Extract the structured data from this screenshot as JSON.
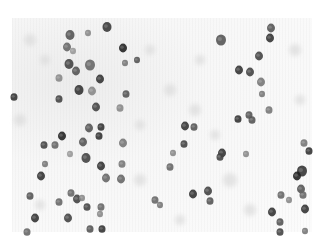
{
  "image": {
    "description": "Grayscale micrograph of stained cell nuclei scattered on a pale speckled background",
    "width": 323,
    "height": 244,
    "field": {
      "x": 12,
      "y": 18,
      "w": 300,
      "h": 214
    },
    "background_color": "#f6f6f6",
    "nucleus_colors": {
      "dark": "#2a2a2a",
      "mid": "#555555",
      "light": "#8a8a8a"
    }
  },
  "nuclei": [
    {
      "x": 107,
      "y": 27,
      "r": 4.5,
      "c": "#3a3a3a"
    },
    {
      "x": 70,
      "y": 35,
      "r": 4.5,
      "c": "#555"
    },
    {
      "x": 123,
      "y": 48,
      "r": 4,
      "c": "#222"
    },
    {
      "x": 88,
      "y": 33,
      "r": 3,
      "c": "#888"
    },
    {
      "x": 67,
      "y": 47,
      "r": 4,
      "c": "#666"
    },
    {
      "x": 73,
      "y": 51,
      "r": 3,
      "c": "#999"
    },
    {
      "x": 69,
      "y": 64,
      "r": 4.5,
      "c": "#444"
    },
    {
      "x": 90,
      "y": 65,
      "r": 5,
      "c": "#666"
    },
    {
      "x": 76,
      "y": 71,
      "r": 4,
      "c": "#555"
    },
    {
      "x": 100,
      "y": 79,
      "r": 4,
      "c": "#333"
    },
    {
      "x": 59,
      "y": 78,
      "r": 3.5,
      "c": "#888"
    },
    {
      "x": 79,
      "y": 90,
      "r": 4.5,
      "c": "#333"
    },
    {
      "x": 92,
      "y": 91,
      "r": 4,
      "c": "#888"
    },
    {
      "x": 59,
      "y": 99,
      "r": 3.5,
      "c": "#444"
    },
    {
      "x": 126,
      "y": 94,
      "r": 3.5,
      "c": "#555"
    },
    {
      "x": 96,
      "y": 107,
      "r": 4,
      "c": "#444"
    },
    {
      "x": 120,
      "y": 108,
      "r": 3.5,
      "c": "#888"
    },
    {
      "x": 14,
      "y": 97,
      "r": 3.5,
      "c": "#333"
    },
    {
      "x": 125,
      "y": 63,
      "r": 3,
      "c": "#777"
    },
    {
      "x": 137,
      "y": 60,
      "r": 3,
      "c": "#555"
    },
    {
      "x": 221,
      "y": 40,
      "r": 5,
      "c": "#555"
    },
    {
      "x": 271,
      "y": 28,
      "r": 4,
      "c": "#555"
    },
    {
      "x": 270,
      "y": 38,
      "r": 4,
      "c": "#333"
    },
    {
      "x": 259,
      "y": 56,
      "r": 4,
      "c": "#444"
    },
    {
      "x": 239,
      "y": 70,
      "r": 4,
      "c": "#333"
    },
    {
      "x": 250,
      "y": 72,
      "r": 4,
      "c": "#444"
    },
    {
      "x": 261,
      "y": 82,
      "r": 4,
      "c": "#777"
    },
    {
      "x": 262,
      "y": 94,
      "r": 3,
      "c": "#777"
    },
    {
      "x": 269,
      "y": 110,
      "r": 3.5,
      "c": "#777"
    },
    {
      "x": 249,
      "y": 115,
      "r": 3.5,
      "c": "#555"
    },
    {
      "x": 238,
      "y": 119,
      "r": 3.5,
      "c": "#333"
    },
    {
      "x": 252,
      "y": 120,
      "r": 3.5,
      "c": "#555"
    },
    {
      "x": 89,
      "y": 128,
      "r": 4,
      "c": "#555"
    },
    {
      "x": 101,
      "y": 127,
      "r": 3.5,
      "c": "#333"
    },
    {
      "x": 62,
      "y": 136,
      "r": 4,
      "c": "#222"
    },
    {
      "x": 44,
      "y": 145,
      "r": 3.5,
      "c": "#444"
    },
    {
      "x": 55,
      "y": 145,
      "r": 3.5,
      "c": "#666"
    },
    {
      "x": 83,
      "y": 142,
      "r": 4,
      "c": "#555"
    },
    {
      "x": 99,
      "y": 136,
      "r": 3.5,
      "c": "#333"
    },
    {
      "x": 123,
      "y": 143,
      "r": 4,
      "c": "#777"
    },
    {
      "x": 70,
      "y": 154,
      "r": 3,
      "c": "#999"
    },
    {
      "x": 86,
      "y": 158,
      "r": 4.5,
      "c": "#444"
    },
    {
      "x": 101,
      "y": 166,
      "r": 4,
      "c": "#333"
    },
    {
      "x": 122,
      "y": 164,
      "r": 3.5,
      "c": "#777"
    },
    {
      "x": 45,
      "y": 164,
      "r": 3,
      "c": "#777"
    },
    {
      "x": 41,
      "y": 176,
      "r": 4,
      "c": "#333"
    },
    {
      "x": 106,
      "y": 178,
      "r": 4,
      "c": "#666"
    },
    {
      "x": 121,
      "y": 179,
      "r": 4,
      "c": "#666"
    },
    {
      "x": 30,
      "y": 196,
      "r": 3.5,
      "c": "#555"
    },
    {
      "x": 71,
      "y": 193,
      "r": 3.5,
      "c": "#666"
    },
    {
      "x": 77,
      "y": 199,
      "r": 4,
      "c": "#444"
    },
    {
      "x": 59,
      "y": 202,
      "r": 3.5,
      "c": "#666"
    },
    {
      "x": 82,
      "y": 198,
      "r": 3,
      "c": "#888"
    },
    {
      "x": 87,
      "y": 207,
      "r": 3.5,
      "c": "#444"
    },
    {
      "x": 101,
      "y": 207,
      "r": 3.5,
      "c": "#666"
    },
    {
      "x": 100,
      "y": 214,
      "r": 3,
      "c": "#888"
    },
    {
      "x": 35,
      "y": 218,
      "r": 4,
      "c": "#333"
    },
    {
      "x": 68,
      "y": 218,
      "r": 4,
      "c": "#444"
    },
    {
      "x": 90,
      "y": 229,
      "r": 3.5,
      "c": "#555"
    },
    {
      "x": 102,
      "y": 229,
      "r": 3.5,
      "c": "#333"
    },
    {
      "x": 27,
      "y": 232,
      "r": 3.5,
      "c": "#666"
    },
    {
      "x": 155,
      "y": 200,
      "r": 3.5,
      "c": "#666"
    },
    {
      "x": 160,
      "y": 205,
      "r": 3,
      "c": "#777"
    },
    {
      "x": 185,
      "y": 126,
      "r": 4,
      "c": "#333"
    },
    {
      "x": 194,
      "y": 127,
      "r": 3.5,
      "c": "#555"
    },
    {
      "x": 184,
      "y": 144,
      "r": 3.5,
      "c": "#444"
    },
    {
      "x": 173,
      "y": 153,
      "r": 3,
      "c": "#888"
    },
    {
      "x": 222,
      "y": 153,
      "r": 4,
      "c": "#333"
    },
    {
      "x": 220,
      "y": 157,
      "r": 3.5,
      "c": "#444"
    },
    {
      "x": 246,
      "y": 154,
      "r": 3,
      "c": "#888"
    },
    {
      "x": 170,
      "y": 167,
      "r": 3.5,
      "c": "#666"
    },
    {
      "x": 193,
      "y": 194,
      "r": 4,
      "c": "#333"
    },
    {
      "x": 208,
      "y": 191,
      "r": 4,
      "c": "#444"
    },
    {
      "x": 210,
      "y": 201,
      "r": 3.5,
      "c": "#555"
    },
    {
      "x": 304,
      "y": 143,
      "r": 3.5,
      "c": "#777"
    },
    {
      "x": 309,
      "y": 151,
      "r": 3.5,
      "c": "#333"
    },
    {
      "x": 302,
      "y": 171,
      "r": 5,
      "c": "#333"
    },
    {
      "x": 297,
      "y": 176,
      "r": 4,
      "c": "#222"
    },
    {
      "x": 301,
      "y": 189,
      "r": 4,
      "c": "#555"
    },
    {
      "x": 303,
      "y": 195,
      "r": 3.5,
      "c": "#666"
    },
    {
      "x": 281,
      "y": 195,
      "r": 3.5,
      "c": "#666"
    },
    {
      "x": 289,
      "y": 200,
      "r": 3,
      "c": "#888"
    },
    {
      "x": 305,
      "y": 209,
      "r": 4,
      "c": "#333"
    },
    {
      "x": 272,
      "y": 212,
      "r": 4,
      "c": "#333"
    },
    {
      "x": 280,
      "y": 222,
      "r": 3.5,
      "c": "#555"
    },
    {
      "x": 280,
      "y": 232,
      "r": 3.5,
      "c": "#444"
    },
    {
      "x": 305,
      "y": 231,
      "r": 3,
      "c": "#777"
    }
  ],
  "specks": [
    {
      "x": 30,
      "y": 40,
      "r": 6
    },
    {
      "x": 45,
      "y": 60,
      "r": 5
    },
    {
      "x": 20,
      "y": 120,
      "r": 6
    },
    {
      "x": 150,
      "y": 50,
      "r": 5
    },
    {
      "x": 170,
      "y": 90,
      "r": 6
    },
    {
      "x": 200,
      "y": 60,
      "r": 5
    },
    {
      "x": 195,
      "y": 110,
      "r": 6
    },
    {
      "x": 295,
      "y": 50,
      "r": 6
    },
    {
      "x": 300,
      "y": 100,
      "r": 5
    },
    {
      "x": 230,
      "y": 180,
      "r": 7
    },
    {
      "x": 250,
      "y": 210,
      "r": 6
    },
    {
      "x": 180,
      "y": 220,
      "r": 5
    },
    {
      "x": 140,
      "y": 125,
      "r": 5
    },
    {
      "x": 40,
      "y": 205,
      "r": 5
    },
    {
      "x": 215,
      "y": 135,
      "r": 5
    },
    {
      "x": 140,
      "y": 180,
      "r": 6
    }
  ]
}
